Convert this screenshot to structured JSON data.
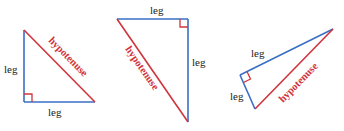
{
  "colors": {
    "leg": "#3a6fc4",
    "hypotenuse": "#d0343c",
    "right_angle_marker": "#d0343c",
    "text": "#222222"
  },
  "triangles": [
    {
      "name": "triangle-1",
      "labels": {
        "leg_vertical": "leg",
        "leg_horizontal": "leg",
        "hypotenuse": "hypotenuse"
      }
    },
    {
      "name": "triangle-2",
      "labels": {
        "leg_top": "leg",
        "leg_vertical": "leg",
        "hypotenuse": "hypotenuse"
      }
    },
    {
      "name": "triangle-3",
      "labels": {
        "leg_long": "leg",
        "leg_short": "leg",
        "hypotenuse": "hypotenuse"
      }
    }
  ]
}
